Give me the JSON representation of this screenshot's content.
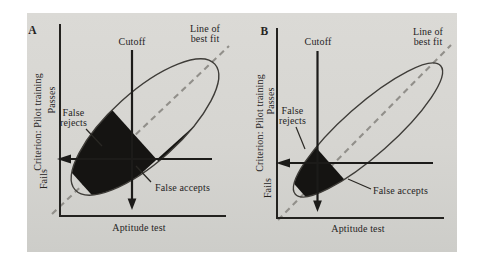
{
  "figure": {
    "background_color": "#d6d5d1",
    "ink_color": "#23221f",
    "dash_color": "#918f8a",
    "shade_color": "#151412",
    "panels": [
      {
        "panel_label": "A",
        "cutoff_label": "Cutoff",
        "best_fit_label_line1": "Line of",
        "best_fit_label_line2": "best fit",
        "false_rejects_line1": "False",
        "false_rejects_line2": "rejects",
        "false_accepts_label": "False accepts",
        "x_axis_label": "Aptitude test",
        "y_axis_label": "Criterion: Pilot training",
        "y_axis_upper_label": "Passes",
        "y_axis_lower_label": "Fails"
      },
      {
        "panel_label": "B",
        "cutoff_label": "Cutoff",
        "best_fit_label_line1": "Line of",
        "best_fit_label_line2": "best fit",
        "false_rejects_line1": "False",
        "false_rejects_line2": "rejects",
        "false_accepts_label": "False accepts",
        "x_axis_label": "Aptitude test",
        "y_axis_label": "Criterion: Pilot training",
        "y_axis_upper_label": "Passes",
        "y_axis_lower_label": "Fails"
      }
    ]
  }
}
